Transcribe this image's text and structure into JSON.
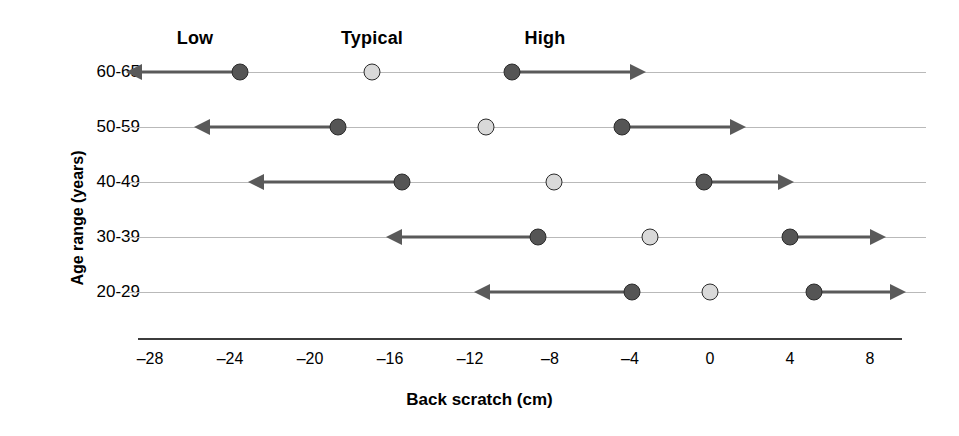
{
  "chart_data": {
    "type": "scatter",
    "title": "",
    "xlabel": "Back scratch (cm)",
    "ylabel": "Age range (years)",
    "xlim": [
      -29,
      9.5
    ],
    "ylim": [
      0,
      6
    ],
    "grid": true,
    "legend_position": "top",
    "xticks": [
      -28,
      -24,
      -20,
      -16,
      -12,
      -8,
      -4,
      0,
      4,
      8
    ],
    "xticklabels": [
      "–28",
      "–24",
      "–20",
      "–16",
      "–12",
      "–8",
      "–4",
      "0",
      "4",
      "8"
    ],
    "categories": [
      "60-65",
      "50-59",
      "40-49",
      "30-39",
      "20-29"
    ],
    "column_headers": [
      "Low",
      "Typical",
      "High"
    ],
    "series": [
      {
        "name": "Low",
        "marker": "dark-circle",
        "arrow": "left",
        "values": [
          -23.5,
          -18.6,
          -15.4,
          -8.6,
          -3.9
        ]
      },
      {
        "name": "Typical",
        "marker": "light-circle",
        "arrow": "none",
        "values": [
          -16.9,
          -11.2,
          -7.8,
          -3.0,
          0.0
        ]
      },
      {
        "name": "High",
        "marker": "dark-circle",
        "arrow": "right",
        "values": [
          -9.9,
          -4.4,
          -0.3,
          4.0,
          5.2
        ]
      }
    ],
    "arrow_ends": {
      "low": [
        -28.4,
        -25.0,
        -22.3,
        -15.4,
        -11.0
      ],
      "high": [
        -4.0,
        1.0,
        3.4,
        8.0,
        9.0
      ]
    },
    "colors": {
      "dark_marker": "#555555",
      "light_marker": "#d9d9d9",
      "marker_outline": "#2b2b2b",
      "arrow": "#5a5a5a",
      "gridline": "#b9b9b9",
      "axis": "#3c3c3c",
      "text": "#000000"
    }
  }
}
